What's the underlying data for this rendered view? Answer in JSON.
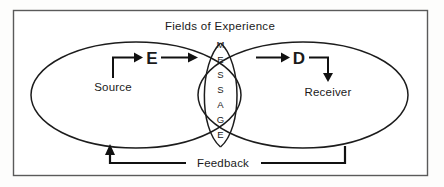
{
  "diagram": {
    "title": "Fields of Experience",
    "frame": {
      "border_color": "#5a5a5a",
      "background": "#ffffff"
    },
    "line_color": "#111111",
    "nodes": {
      "source_label": "Source",
      "receiver_label": "Receiver",
      "encoder_label": "E",
      "decoder_label": "D",
      "feedback_label": "Feedback"
    },
    "message": {
      "word": "MESSAGE",
      "letters": [
        "M",
        "E",
        "S",
        "S",
        "A",
        "G",
        "E"
      ]
    },
    "fields": {
      "left_field_name": "sender-field-of-experience",
      "right_field_name": "receiver-field-of-experience",
      "overlap_name": "shared-message-overlap"
    }
  }
}
